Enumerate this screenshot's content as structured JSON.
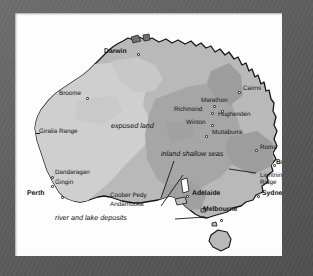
{
  "image": {
    "kind": "scanned-map-figure",
    "subject": "Palaeogeographic map of Australia showing Cretaceous exposed land and inland shallow seas",
    "frame_color": "#5f5f5f",
    "paper_color": "#fdfdfd"
  },
  "map": {
    "land_color": "#b9b9b9",
    "exposed_land_color": "#cfcfcf",
    "shallow_sea_color": "#a6a6a6",
    "coast_line_color": "#17171b",
    "legend_units": [
      {
        "name": "exposed-land",
        "label": "exposed land",
        "style": "italic",
        "x": 96,
        "y": 113
      },
      {
        "name": "inland-shallow-seas",
        "label": "inland shallow seas",
        "style": "italic",
        "x": 146,
        "y": 141
      },
      {
        "name": "river-and-lake-deposits",
        "label": "river and lake deposits",
        "style": "italic",
        "x": 77,
        "y": 205
      }
    ],
    "places": [
      {
        "name": "darwin",
        "label": "Darwin",
        "weight": "major",
        "x": 89,
        "y": 40,
        "dot_x": 122,
        "dot_y": 40
      },
      {
        "name": "broome",
        "label": "Broome",
        "weight": "city",
        "x": 44,
        "y": 81,
        "dot_x": 71,
        "dot_y": 84
      },
      {
        "name": "giralia-range",
        "label": "Giralia Range",
        "weight": "city",
        "x": 24,
        "y": 119,
        "dot_x": null,
        "dot_y": null
      },
      {
        "name": "dandaragan",
        "label": "Dandaragan",
        "weight": "city",
        "x": 40,
        "y": 160,
        "dot_x": 36,
        "dot_y": 163
      },
      {
        "name": "gingin",
        "label": "Gingin",
        "weight": "city",
        "x": 40,
        "y": 170,
        "dot_x": 36,
        "dot_y": 172
      },
      {
        "name": "perth",
        "label": "Perth",
        "weight": "major",
        "x": 20,
        "y": 181,
        "dot_x": 46,
        "dot_y": 183
      },
      {
        "name": "coober-pedy",
        "label": "Coober Pedy",
        "weight": "city",
        "x": 105,
        "y": 183,
        "dot_x": null,
        "dot_y": null
      },
      {
        "name": "andamooka",
        "label": "Andamooka",
        "weight": "city",
        "x": 105,
        "y": 192,
        "dot_x": null,
        "dot_y": null
      },
      {
        "name": "adelaide",
        "label": "Adelaide",
        "weight": "major",
        "x": 177,
        "y": 181,
        "dot_x": 171,
        "dot_y": 182
      },
      {
        "name": "melbourne",
        "label": "Melbourne",
        "weight": "major",
        "x": 188,
        "y": 197,
        "dot_x": 205,
        "dot_y": 206
      },
      {
        "name": "sydney",
        "label": "Sydney",
        "weight": "major",
        "x": 248,
        "y": 181,
        "dot_x": 242,
        "dot_y": 182
      },
      {
        "name": "lightning-ridge",
        "label": "Lightning\nRidge",
        "weight": "city",
        "x": 245,
        "y": 163,
        "dot_x": null,
        "dot_y": null
      },
      {
        "name": "brisbane",
        "label": "Brisbane",
        "weight": "major",
        "x": 262,
        "y": 150,
        "dot_x": 258,
        "dot_y": 151
      },
      {
        "name": "roma",
        "label": "Roma",
        "weight": "city",
        "x": 245,
        "y": 135,
        "dot_x": 240,
        "dot_y": 136
      },
      {
        "name": "cairns",
        "label": "Cairns",
        "weight": "city",
        "x": 228,
        "y": 76,
        "dot_x": 223,
        "dot_y": 78
      },
      {
        "name": "marathon",
        "label": "Marathon",
        "weight": "city",
        "x": 186,
        "y": 88,
        "dot_x": null,
        "dot_y": null
      },
      {
        "name": "richmond",
        "label": "Richmond",
        "weight": "city",
        "x": 161,
        "y": 97,
        "dot_x": 196,
        "dot_y": 99
      },
      {
        "name": "hughenden",
        "label": "Hughenden",
        "weight": "city",
        "x": 203,
        "y": 102,
        "dot_x": null,
        "dot_y": null
      },
      {
        "name": "winton",
        "label": "Winton",
        "weight": "city",
        "x": 172,
        "y": 110,
        "dot_x": 196,
        "dot_y": 111
      },
      {
        "name": "muttaburra",
        "label": "Muttaburra",
        "weight": "city",
        "x": 197,
        "y": 120,
        "dot_x": null,
        "dot_y": null
      }
    ],
    "leader_lines": [
      {
        "name": "leader-coober-pedy",
        "x1": 146,
        "y1": 185,
        "x2": 159,
        "y2": 148
      },
      {
        "name": "leader-andamooka",
        "x1": 146,
        "y1": 193,
        "x2": 168,
        "y2": 162
      },
      {
        "name": "leader-lightning-ridge",
        "x1": 241,
        "y1": 160,
        "x2": 214,
        "y2": 156
      },
      {
        "name": "leader-river-lake",
        "x1": 160,
        "y1": 206,
        "x2": 190,
        "y2": 204
      }
    ]
  }
}
